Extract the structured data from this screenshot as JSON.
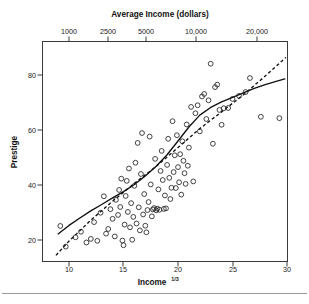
{
  "chart_data": {
    "type": "scatter",
    "title": "",
    "xlabel": "Income¹ᐟ³",
    "xlabel_base": "Income",
    "xlabel_exponent": "1/3",
    "ylabel": "Prestige",
    "top_axis_label": "Average Income (dollars)",
    "xlim": [
      8.7,
      30.3
    ],
    "ylim": [
      14.0,
      88.0
    ],
    "grid": false,
    "legend": "none",
    "xticks": [
      10,
      15,
      20,
      25,
      30
    ],
    "xtick_labels": [
      "10",
      "15",
      "20",
      "25",
      "30"
    ],
    "yticks": [
      20,
      40,
      60,
      80
    ],
    "ytick_labels": [
      "20",
      "40",
      "60",
      "80"
    ],
    "top_xticks": [
      10.0,
      13.572,
      17.1,
      21.544,
      27.144
    ],
    "top_xtick_labels": [
      "1000",
      "2500",
      "5000",
      "10,000",
      "20,000"
    ],
    "marker_style": "open-circle",
    "points": [
      [
        9.2,
        25.1
      ],
      [
        9.7,
        17.6
      ],
      [
        10.6,
        21.0
      ],
      [
        11.1,
        23.0
      ],
      [
        11.6,
        19.1
      ],
      [
        12.0,
        20.4
      ],
      [
        12.3,
        26.5
      ],
      [
        12.6,
        19.7
      ],
      [
        12.9,
        29.9
      ],
      [
        13.2,
        35.9
      ],
      [
        13.4,
        22.3
      ],
      [
        13.6,
        24.0
      ],
      [
        13.8,
        31.2
      ],
      [
        14.0,
        27.7
      ],
      [
        14.2,
        21.3
      ],
      [
        14.3,
        34.6
      ],
      [
        14.5,
        29.1
      ],
      [
        14.6,
        38.2
      ],
      [
        14.7,
        32.0
      ],
      [
        14.8,
        42.3
      ],
      [
        14.9,
        19.8
      ],
      [
        15.0,
        18.1
      ],
      [
        15.1,
        25.6
      ],
      [
        15.2,
        36.0
      ],
      [
        15.3,
        41.5
      ],
      [
        15.4,
        30.2
      ],
      [
        15.5,
        46.0
      ],
      [
        15.6,
        24.6
      ],
      [
        15.7,
        33.4
      ],
      [
        15.8,
        20.1
      ],
      [
        15.9,
        28.4
      ],
      [
        16.0,
        39.7
      ],
      [
        16.1,
        48.1
      ],
      [
        16.2,
        26.0
      ],
      [
        16.3,
        55.3
      ],
      [
        16.4,
        31.9
      ],
      [
        16.5,
        23.5
      ],
      [
        16.6,
        44.0
      ],
      [
        16.7,
        58.9
      ],
      [
        16.8,
        29.3
      ],
      [
        16.9,
        36.7
      ],
      [
        17.0,
        25.2
      ],
      [
        17.1,
        22.8
      ],
      [
        17.2,
        30.9
      ],
      [
        17.3,
        33.8
      ],
      [
        17.4,
        57.6
      ],
      [
        17.5,
        40.2
      ],
      [
        17.6,
        28.6
      ],
      [
        17.7,
        31.1
      ],
      [
        17.8,
        31.6
      ],
      [
        17.9,
        49.5
      ],
      [
        18.0,
        30.8
      ],
      [
        18.1,
        31.4
      ],
      [
        18.2,
        38.4
      ],
      [
        18.3,
        31.0
      ],
      [
        18.4,
        45.1
      ],
      [
        18.5,
        52.4
      ],
      [
        18.6,
        41.8
      ],
      [
        18.7,
        31.3
      ],
      [
        18.8,
        36.2
      ],
      [
        18.9,
        31.5
      ],
      [
        19.0,
        47.3
      ],
      [
        19.1,
        56.8
      ],
      [
        19.2,
        42.6
      ],
      [
        19.3,
        34.9
      ],
      [
        19.4,
        39.0
      ],
      [
        19.5,
        63.2
      ],
      [
        19.6,
        44.7
      ],
      [
        19.7,
        50.8
      ],
      [
        19.8,
        38.9
      ],
      [
        19.9,
        58.1
      ],
      [
        20.0,
        46.5
      ],
      [
        20.1,
        41.0
      ],
      [
        20.2,
        51.2
      ],
      [
        20.3,
        36.5
      ],
      [
        20.4,
        55.9
      ],
      [
        20.5,
        48.8
      ],
      [
        20.6,
        44.3
      ],
      [
        20.7,
        40.4
      ],
      [
        20.8,
        62.0
      ],
      [
        20.9,
        47.0
      ],
      [
        21.0,
        53.6
      ],
      [
        21.2,
        68.4
      ],
      [
        21.4,
        41.3
      ],
      [
        21.6,
        66.1
      ],
      [
        21.8,
        69.0
      ],
      [
        22.0,
        59.5
      ],
      [
        22.2,
        72.2
      ],
      [
        22.4,
        73.1
      ],
      [
        22.6,
        64.0
      ],
      [
        22.8,
        70.8
      ],
      [
        23.0,
        84.1
      ],
      [
        23.2,
        55.0
      ],
      [
        23.4,
        75.6
      ],
      [
        23.6,
        76.5
      ],
      [
        23.8,
        67.3
      ],
      [
        24.0,
        61.9
      ],
      [
        24.2,
        67.9
      ],
      [
        24.6,
        68.0
      ],
      [
        25.0,
        71.3
      ],
      [
        25.6,
        72.4
      ],
      [
        26.2,
        73.8
      ],
      [
        26.6,
        78.9
      ],
      [
        27.6,
        64.8
      ],
      [
        29.3,
        64.3
      ]
    ],
    "curves": [
      {
        "name": "lowess-smooth",
        "style": "solid",
        "points": [
          [
            9.0,
            22.2
          ],
          [
            10.0,
            25.3
          ],
          [
            11.0,
            28.0
          ],
          [
            12.0,
            30.6
          ],
          [
            13.0,
            32.9
          ],
          [
            14.0,
            35.3
          ],
          [
            15.0,
            37.6
          ],
          [
            16.0,
            40.2
          ],
          [
            17.0,
            43.3
          ],
          [
            18.0,
            46.8
          ],
          [
            19.0,
            51.0
          ],
          [
            20.0,
            56.0
          ],
          [
            21.0,
            61.1
          ],
          [
            22.0,
            65.4
          ],
          [
            23.0,
            68.2
          ],
          [
            24.0,
            70.2
          ],
          [
            25.0,
            71.9
          ],
          [
            26.0,
            73.5
          ],
          [
            27.0,
            75.1
          ],
          [
            28.0,
            76.5
          ],
          [
            29.0,
            77.7
          ],
          [
            29.8,
            78.6
          ]
        ]
      },
      {
        "name": "linear-fit",
        "style": "dashed",
        "points": [
          [
            8.8,
            14.4
          ],
          [
            10.0,
            19.6
          ],
          [
            12.0,
            27.2
          ],
          [
            14.0,
            34.1
          ],
          [
            16.0,
            40.6
          ],
          [
            18.0,
            46.8
          ],
          [
            20.0,
            53.6
          ],
          [
            22.0,
            60.5
          ],
          [
            24.0,
            66.6
          ],
          [
            26.0,
            72.8
          ],
          [
            28.0,
            79.6
          ],
          [
            29.9,
            86.4
          ]
        ]
      }
    ]
  },
  "page": {
    "has_bottom_rule": true
  }
}
